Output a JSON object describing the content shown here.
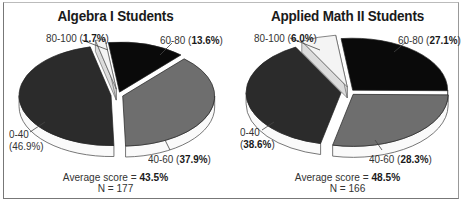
{
  "chart_data": [
    {
      "type": "pie",
      "style": "3d-exploded",
      "title": "Algebra I Students",
      "categories": [
        "0-40",
        "40-60",
        "60-80",
        "80-100"
      ],
      "values": [
        46.9,
        37.9,
        13.6,
        1.7
      ],
      "unit": "%",
      "colors": [
        "#2b2b2b",
        "#6e6e6e",
        "#0a0a0a",
        "#f4f4f4"
      ],
      "labels": [
        {
          "range": "0-40",
          "pct": "(46.9%)",
          "bold": false
        },
        {
          "range": "40-60",
          "pct": "37.9%",
          "bold": true
        },
        {
          "range": "60-80",
          "pct": "13.6%",
          "bold": true
        },
        {
          "range": "80-100",
          "pct": "1.7%",
          "bold": true
        }
      ],
      "average_score_label": "Average score = ",
      "average_score": "43.5%",
      "n_label": "N = 177",
      "n": 177
    },
    {
      "type": "pie",
      "style": "3d-exploded",
      "title": "Applied Math II Students",
      "categories": [
        "0-40",
        "40-60",
        "60-80",
        "80-100"
      ],
      "values": [
        38.6,
        28.3,
        27.1,
        6.0
      ],
      "unit": "%",
      "colors": [
        "#2b2b2b",
        "#6e6e6e",
        "#0a0a0a",
        "#f4f4f4"
      ],
      "labels": [
        {
          "range": "0-40",
          "pct": "38.6%",
          "bold": true
        },
        {
          "range": "40-60",
          "pct": "28.3%",
          "bold": true
        },
        {
          "range": "60-80",
          "pct": "27.1%",
          "bold": true
        },
        {
          "range": "80-100",
          "pct": "6.0%",
          "bold": true
        }
      ],
      "average_score_label": "Average score = ",
      "average_score": "48.5%",
      "n_label": "N = 166",
      "n": 166
    }
  ]
}
